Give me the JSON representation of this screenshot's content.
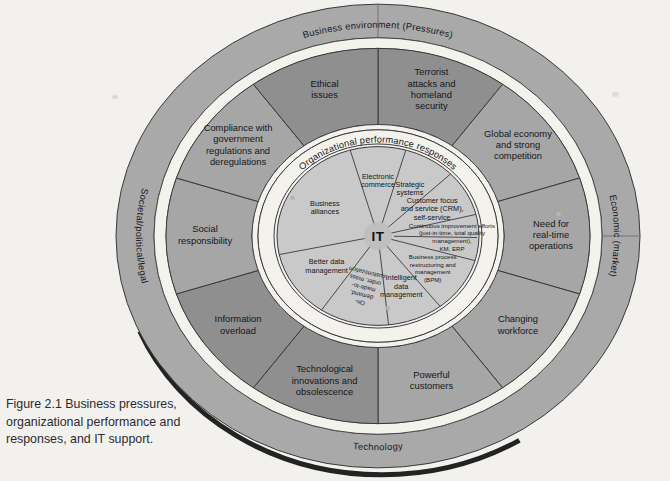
{
  "figure": {
    "caption": "Figure 2.1  Business pressures, organizational performance and responses, and IT support.",
    "type": "concentric-ring-diagram"
  },
  "diagram": {
    "center_hub": "IT",
    "outer_ring": {
      "name": "business-environment-ring",
      "labels": [
        {
          "id": "top",
          "text": "Business environment (Pressures)"
        },
        {
          "id": "right",
          "text": "Economic (market)"
        },
        {
          "id": "bottom",
          "text": "Technology"
        },
        {
          "id": "left",
          "text": "Societal/political/legal"
        }
      ]
    },
    "middle_ring": {
      "name": "business-pressures-ring",
      "segments": [
        {
          "index": 0,
          "lines": [
            "Terrorist",
            "attacks and",
            "homeland",
            "security"
          ]
        },
        {
          "index": 1,
          "lines": [
            "Global economy",
            "and strong",
            "competition"
          ]
        },
        {
          "index": 2,
          "lines": [
            "Need for",
            "real-time",
            "operations"
          ]
        },
        {
          "index": 3,
          "lines": [
            "Changing",
            "workforce"
          ]
        },
        {
          "index": 4,
          "lines": [
            "Powerful",
            "customers"
          ]
        },
        {
          "index": 5,
          "lines": [
            "Technological",
            "innovations and",
            "obsolescence"
          ]
        },
        {
          "index": 6,
          "lines": [
            "Information",
            "overload"
          ]
        },
        {
          "index": 7,
          "lines": [
            "Social",
            "responsibility"
          ]
        },
        {
          "index": 8,
          "lines": [
            "Compliance with",
            "government",
            "regulations and",
            "deregulations"
          ]
        },
        {
          "index": 9,
          "lines": [
            "Ethical",
            "issues"
          ]
        }
      ]
    },
    "inner_band": {
      "name": "organizational-performance-band",
      "label": "Organizational performance responses"
    },
    "inner_ring": {
      "name": "it-responses-ring",
      "segments": [
        {
          "index": 0,
          "lines": [
            "Electronic",
            "commerce"
          ]
        },
        {
          "index": 1,
          "lines": [
            "Strategic",
            "systems"
          ]
        },
        {
          "index": 2,
          "lines": [
            "Customer focus",
            "and service (CRM),",
            "self-service"
          ]
        },
        {
          "index": 3,
          "lines": [
            "Continuous improvement efforts",
            "(just-in-time, total quality",
            "management),",
            "KM, ERP"
          ]
        },
        {
          "index": 4,
          "lines": [
            "Business process",
            "restructuring and",
            "management",
            "(BPM)"
          ]
        },
        {
          "index": 5,
          "lines": [
            "Intelligent",
            "data",
            "management"
          ]
        },
        {
          "index": 6,
          "lines": [
            "On-",
            "demand,",
            "made-to-",
            "order, mass",
            "customization"
          ]
        },
        {
          "index": 7,
          "lines": [
            "Better data",
            "management"
          ]
        },
        {
          "index": 8,
          "lines": [
            "Business",
            "alliances"
          ]
        }
      ]
    }
  },
  "colors": {
    "outer_ring_fill": "#a9a9a9",
    "middle_ring_fill": "#a6a6a6",
    "middle_ring_fill_dark": "#8f8f8f",
    "inner_ring_fill": "#c9c9c9",
    "band_fill": "#f4f2ed",
    "hub_fill": "#bdbdbd",
    "stroke": "#3a3a3c",
    "shadow": "#111111",
    "page_bg": "#f3f1ee",
    "caption_text": "#2b2b2f"
  }
}
